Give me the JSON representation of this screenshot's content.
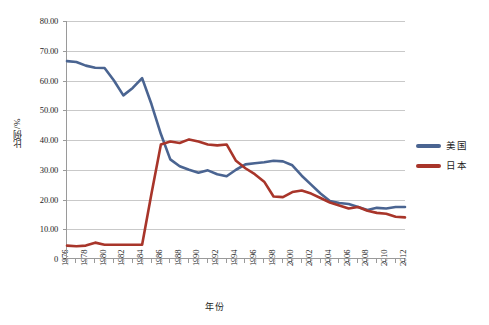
{
  "chart_data": {
    "type": "line",
    "title": "",
    "xlabel": "年份",
    "ylabel": "比例/%",
    "xlim": [
      1976,
      2012
    ],
    "ylim": [
      0,
      80
    ],
    "grid": true,
    "legend_position": "right",
    "y_ticks": [
      "0",
      "10.00",
      "20.00",
      "30.00",
      "40.00",
      "50.00",
      "60.00",
      "70.00",
      "80.00"
    ],
    "y_tick_values": [
      0,
      10,
      20,
      30,
      40,
      50,
      60,
      70,
      80
    ],
    "x_tick_labels": [
      "1976",
      "1978",
      "1980",
      "1982",
      "1984",
      "1986",
      "1988",
      "1990",
      "1992",
      "1994",
      "1996",
      "1998",
      "2000",
      "2002",
      "2004",
      "2006",
      "2008",
      "2010",
      "2012"
    ],
    "x": [
      1976,
      1977,
      1978,
      1979,
      1980,
      1981,
      1982,
      1983,
      1984,
      1985,
      1986,
      1987,
      1988,
      1989,
      1990,
      1991,
      1992,
      1993,
      1994,
      1995,
      1996,
      1997,
      1998,
      1999,
      2000,
      2001,
      2002,
      2003,
      2004,
      2005,
      2006,
      2007,
      2008,
      2009,
      2010,
      2011,
      2012
    ],
    "series": [
      {
        "name": "美国",
        "color": "#4A6491",
        "values": [
          66.5,
          66.2,
          65.0,
          64.3,
          64.2,
          60.0,
          55.0,
          57.5,
          60.8,
          52.0,
          42.0,
          33.5,
          31.2,
          30.0,
          29.0,
          29.8,
          28.5,
          27.8,
          30.0,
          31.8,
          32.2,
          32.5,
          33.0,
          32.8,
          31.5,
          28.0,
          25.0,
          22.0,
          19.5,
          18.8,
          18.5,
          17.5,
          16.5,
          17.2,
          17.0,
          17.5,
          17.5
        ]
      },
      {
        "name": "日本",
        "color": "#A8352A",
        "values": [
          4.5,
          4.3,
          4.5,
          5.5,
          4.8,
          4.8,
          4.8,
          4.8,
          4.8,
          22.0,
          38.5,
          39.5,
          39.0,
          40.2,
          39.5,
          38.5,
          38.2,
          38.5,
          33.0,
          30.5,
          28.5,
          26.0,
          21.0,
          20.8,
          22.5,
          23.0,
          22.0,
          20.5,
          19.0,
          18.0,
          17.0,
          17.5,
          16.2,
          15.5,
          15.2,
          14.2,
          14.0
        ]
      }
    ]
  },
  "legend": {
    "items": [
      {
        "label": "美国",
        "color": "#4A6491"
      },
      {
        "label": "日本",
        "color": "#A8352A"
      }
    ]
  },
  "axes": {
    "y_title": "比例/%",
    "x_title": "年份"
  },
  "caption": {
    "text": ""
  }
}
